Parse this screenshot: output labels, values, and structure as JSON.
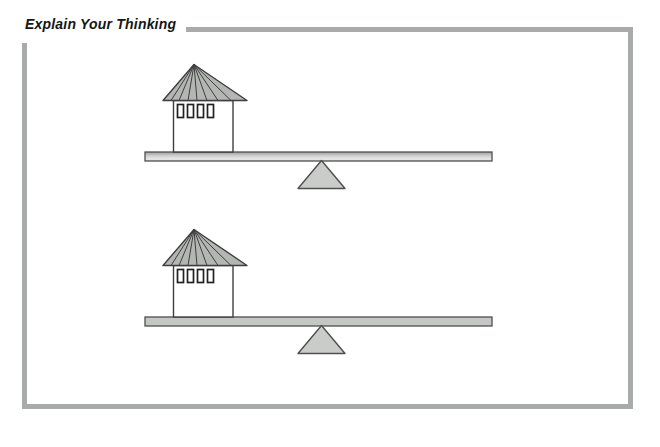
{
  "header": {
    "title": "Explain Your Thinking"
  },
  "colors": {
    "frame": "#a8aba9",
    "ink": "#3f3f3f",
    "title-ink": "#161616",
    "roof-fill": "#b3b6b3",
    "tower-fill": "#ffffff",
    "window-fill": "#ffffff",
    "plank-gray": "#c4c7c4",
    "fulcrum-fill": "#c9ccc9"
  },
  "figure": {
    "seesaws": [
      {
        "name": "top-seesaw",
        "object_on_plank": "tower at left end",
        "plank_shading": "light",
        "fulcrum": "triangle under middle of plank"
      },
      {
        "name": "bottom-seesaw",
        "object_on_plank": "tower at left end",
        "plank_shading": "gray",
        "fulcrum": "triangle under middle of plank"
      }
    ]
  }
}
